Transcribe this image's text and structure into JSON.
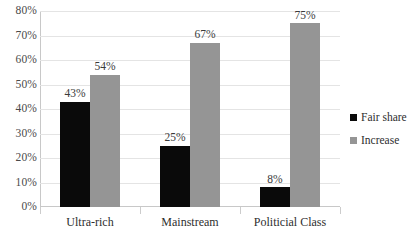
{
  "chart_data": {
    "type": "bar",
    "title": "",
    "subtitle": "",
    "xlabel": "",
    "ylabel": "",
    "categories": [
      "Ultra-rich",
      "Mainstream",
      "Politicial Class"
    ],
    "series": [
      {
        "name": "Fair share",
        "color": "#0a0a0a",
        "values": [
          43,
          25,
          8
        ],
        "labels": [
          "43%",
          "25%",
          "8%"
        ]
      },
      {
        "name": "Increase",
        "color": "#959595",
        "values": [
          54,
          67,
          75
        ],
        "labels": [
          "54%",
          "67%",
          "75%"
        ]
      }
    ],
    "ylim": [
      0,
      80
    ],
    "y_ticks": [
      0,
      10,
      20,
      30,
      40,
      50,
      60,
      70,
      80
    ],
    "y_tick_labels": [
      "0%",
      "10%",
      "20%",
      "30%",
      "40%",
      "50%",
      "60%",
      "70%",
      "80%"
    ],
    "grid": true,
    "grid_color": "#e4e4e4",
    "legend_position": "right",
    "data_labels": true,
    "background": "#ffffff"
  },
  "legend": {
    "items": [
      {
        "label": "Fair share",
        "color": "#0a0a0a"
      },
      {
        "label": "Increase",
        "color": "#959595"
      }
    ]
  }
}
